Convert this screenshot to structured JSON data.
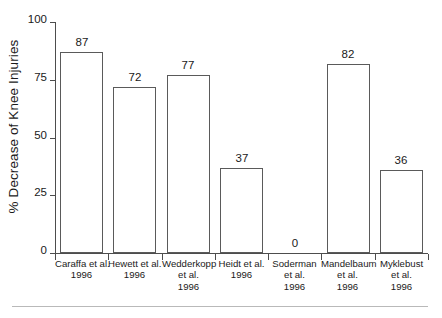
{
  "chart_data": {
    "type": "bar",
    "title": "",
    "subtitle": "",
    "xlabel": "",
    "ylabel": "% Decrease of Knee Injuries",
    "ylim": [
      0,
      100
    ],
    "yticks": [
      0,
      25,
      50,
      75,
      100
    ],
    "ytick_labels": [
      "0",
      "25",
      "50",
      "75",
      "100"
    ],
    "grid": false,
    "legend": null,
    "categories": [
      "Caraffa et al.\n1996",
      "Hewett et al.\n1996",
      "Wedderkopp\net al.\n1996",
      "Heidt et al.\n1996",
      "Soderman\net al.\n1996",
      "Mandelbaum\net al.\n1996",
      "Myklebust\net al.\n1996"
    ],
    "category_lines": [
      [
        "Caraffa et al.",
        "1996"
      ],
      [
        "Hewett et al.",
        "1996"
      ],
      [
        "Wedderkopp",
        "et al.",
        "1996"
      ],
      [
        "Heidt et al.",
        "1996"
      ],
      [
        "Soderman",
        "et al.",
        "1996"
      ],
      [
        "Mandelbaum",
        "et al.",
        "1996"
      ],
      [
        "Myklebust",
        "et al.",
        "1996"
      ]
    ],
    "values": [
      87,
      72,
      77,
      37,
      0,
      82,
      36
    ],
    "value_labels": [
      "87",
      "72",
      "77",
      "37",
      "0",
      "82",
      "36"
    ],
    "bar_style": {
      "fill": "#ffffff",
      "edge": "#5a5a5a"
    },
    "axis_color": "#4d4d4d",
    "text_color": "#1a1a1a"
  },
  "figure": {
    "background": "#ffffff",
    "rule_color": "#b9b9b9"
  }
}
